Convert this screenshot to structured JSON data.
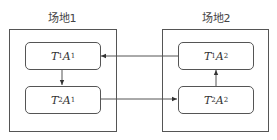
{
  "sites": [
    {
      "label": "场地1",
      "nodes": [
        {
          "T": "T",
          "t_sub": "1",
          "A": "A",
          "a_sub": "1"
        },
        {
          "T": "T",
          "t_sub": "2",
          "A": "A",
          "a_sub": "1"
        }
      ]
    },
    {
      "label": "场地2",
      "nodes": [
        {
          "T": "T",
          "t_sub": "1",
          "A": "A",
          "a_sub": "2"
        },
        {
          "T": "T",
          "t_sub": "2",
          "A": "A",
          "a_sub": "2"
        }
      ]
    }
  ],
  "edges": [
    {
      "from": "T2A1",
      "to": "T2A2"
    },
    {
      "from": "T2A2",
      "to": "T1A2"
    },
    {
      "from": "T1A2",
      "to": "T1A1"
    },
    {
      "from": "T1A1",
      "to": "T2A1"
    }
  ],
  "colors": {
    "line": "#555555",
    "text": "#333333"
  }
}
